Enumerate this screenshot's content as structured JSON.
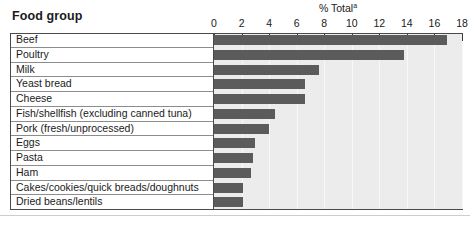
{
  "header": {
    "food_group_label": "Food group",
    "axis_title": "% Total",
    "axis_title_superscript": "a"
  },
  "colors": {
    "bar": "#5b5b5b",
    "plot_background": "#ececec",
    "frame": "#4a4a4a",
    "row_separator": "#8c8c8c",
    "gridline": "#f8f8f8",
    "text": "#1a1a1a"
  },
  "chart_data": {
    "type": "bar",
    "orientation": "horizontal",
    "title": "% Total",
    "xlabel": "% Total",
    "ylabel": "Food group",
    "xlim": [
      0,
      18
    ],
    "xticks": [
      0,
      2,
      4,
      6,
      8,
      10,
      12,
      14,
      16,
      18
    ],
    "xtick_labels": [
      "0",
      "2",
      "4",
      "6",
      "8",
      "10",
      "12",
      "14",
      "16",
      "18"
    ],
    "grid": true,
    "legend": null,
    "categories": [
      "Beef",
      "Poultry",
      "Milk",
      "Yeast bread",
      "Cheese",
      "Fish/shellfish (excluding canned tuna)",
      "Pork (fresh/unprocessed)",
      "Eggs",
      "Pasta",
      "Ham",
      "Cakes/cookies/quick breads/doughnuts",
      "Dried beans/lentils"
    ],
    "values": [
      16.9,
      13.8,
      7.6,
      6.6,
      6.6,
      4.4,
      4.0,
      3.0,
      2.8,
      2.7,
      2.1,
      2.1
    ]
  }
}
